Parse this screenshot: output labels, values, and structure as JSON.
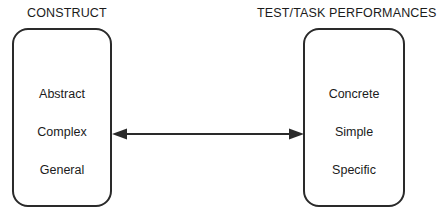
{
  "diagram": {
    "type": "two-box-bidirectional-relationship",
    "background_color": "#ffffff",
    "stroke_color": "#2a2a2a",
    "text_color": "#1b1b1b",
    "left": {
      "header": "CONSTRUCT",
      "attributes": [
        "Abstract",
        "Complex",
        "General"
      ]
    },
    "right": {
      "header": "TEST/TASK PERFORMANCES",
      "attributes": [
        "Concrete",
        "Simple",
        "Specific"
      ]
    },
    "connector": {
      "name": "double-headed-arrow",
      "direction": "bidirectional",
      "label": ""
    }
  }
}
